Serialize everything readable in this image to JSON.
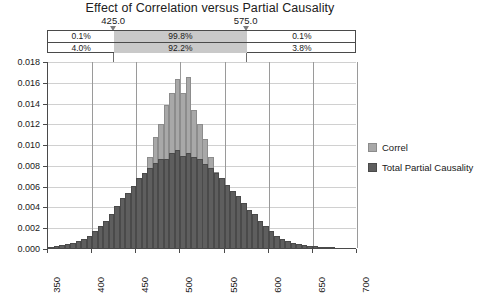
{
  "chart_data": {
    "type": "bar",
    "title": "Effect of Correlation versus Partial Causality",
    "xlabel": "",
    "ylabel": "",
    "xlim": [
      350,
      700
    ],
    "ylim": [
      0,
      0.018
    ],
    "grid": true,
    "legend_position": "right",
    "xticks": [
      "350",
      "400",
      "450",
      "500",
      "550",
      "600",
      "650",
      "700"
    ],
    "xtick_values": [
      350,
      400,
      450,
      500,
      550,
      600,
      650,
      700
    ],
    "yticks": [
      "0.000",
      "0.002",
      "0.004",
      "0.006",
      "0.008",
      "0.010",
      "0.012",
      "0.014",
      "0.016",
      "0.018"
    ],
    "ytick_values": [
      0,
      0.002,
      0.004,
      0.006,
      0.008,
      0.01,
      0.012,
      0.014,
      0.016,
      0.018
    ],
    "bin_width": 6.25,
    "x": [
      353.1,
      359.4,
      365.6,
      371.9,
      378.1,
      384.4,
      390.6,
      396.9,
      403.1,
      409.4,
      415.6,
      421.9,
      428.1,
      434.4,
      440.6,
      446.9,
      453.1,
      459.4,
      465.6,
      471.9,
      478.1,
      484.4,
      490.6,
      496.9,
      503.1,
      509.4,
      515.6,
      521.9,
      528.1,
      534.4,
      540.6,
      546.9,
      553.1,
      559.4,
      565.6,
      571.9,
      578.1,
      584.4,
      590.6,
      596.9,
      603.1,
      609.4,
      615.6,
      621.9,
      628.1,
      634.4,
      640.6,
      646.9,
      653.1,
      659.4,
      665.6,
      671.9
    ],
    "series": [
      {
        "name": "Correl",
        "color": "#a8a8a8",
        "values": [
          0,
          0,
          0,
          0,
          0,
          0,
          0,
          0,
          0,
          0,
          0.0002,
          0.0004,
          0.0009,
          0.0016,
          0.0026,
          0.0036,
          0.0051,
          0.0071,
          0.0088,
          0.0107,
          0.0119,
          0.0138,
          0.0149,
          0.0163,
          0.0149,
          0.0165,
          0.0133,
          0.0119,
          0.0105,
          0.0088,
          0.0073,
          0.0058,
          0.0042,
          0.003,
          0.002,
          0.0011,
          0.0006,
          0.0003,
          0.0001,
          0,
          0,
          0,
          0,
          0,
          0,
          0,
          0,
          0,
          0,
          0,
          0,
          0
        ]
      },
      {
        "name": "Total Partial Causality",
        "color": "#5e5e5e",
        "values": [
          0.0001,
          0.0002,
          0.0003,
          0.0004,
          0.0005,
          0.0007,
          0.0009,
          0.0012,
          0.0016,
          0.0021,
          0.0026,
          0.0033,
          0.004,
          0.0048,
          0.0053,
          0.006,
          0.0067,
          0.0072,
          0.0077,
          0.0082,
          0.0086,
          0.0086,
          0.0091,
          0.0094,
          0.0089,
          0.0091,
          0.0088,
          0.0086,
          0.0081,
          0.0077,
          0.0072,
          0.0067,
          0.0061,
          0.0055,
          0.005,
          0.0043,
          0.0037,
          0.0033,
          0.0026,
          0.0021,
          0.0016,
          0.0012,
          0.0009,
          0.0007,
          0.0005,
          0.0004,
          0.0003,
          0.0002,
          0.0002,
          0.0001,
          0.0001,
          0.0001
        ]
      }
    ],
    "markers": [
      {
        "label": "425.0",
        "value": 425.0
      },
      {
        "label": "575.0",
        "value": 575.0
      }
    ],
    "percent_table": {
      "rows": [
        {
          "series": "Correl",
          "left": "0.1%",
          "middle": "99.8%",
          "right": "0.1%"
        },
        {
          "series": "Total Partial Causality",
          "left": "4.0%",
          "middle": "92.2%",
          "right": "3.8%"
        }
      ]
    }
  },
  "legend": {
    "items": [
      {
        "label": "Correl"
      },
      {
        "label": "Total Partial Causality"
      }
    ]
  }
}
